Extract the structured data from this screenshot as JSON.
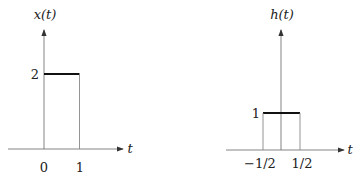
{
  "figures": [
    {
      "id": "x",
      "title": "x(t)",
      "xaxis_label": "t",
      "ticks_x": [
        "0",
        "1"
      ],
      "ticks_y": [
        "2"
      ],
      "pulse": {
        "start": 0,
        "end": 1,
        "height": 2
      }
    },
    {
      "id": "h",
      "title": "h(t)",
      "xaxis_label": "t",
      "ticks_x": [
        "−1/2",
        "1/2"
      ],
      "ticks_y": [
        "1"
      ],
      "pulse": {
        "start": -0.5,
        "end": 0.5,
        "height": 1
      }
    }
  ],
  "colors": {
    "axis": "#555555",
    "pulse_top": "#111111",
    "pulse_side": "#666666"
  }
}
